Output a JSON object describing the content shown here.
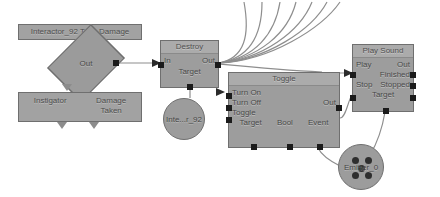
{
  "editor": {
    "name": "node-graph-editor",
    "background": "#ffffff",
    "node_fill": "#9d9d9d",
    "node_header_fill": "#ababab",
    "node_border": "#6f6f6f",
    "port_color": "#1b1b1b",
    "wire_color": "#8e8e8e"
  },
  "nodes": {
    "take_damage": {
      "title": "Interactor_92 Take Damage"
    },
    "out_diamond": {
      "label": "Out"
    },
    "event_params": {
      "param1": "Instigator",
      "param2": "Damage",
      "param3": "Taken"
    },
    "destroy": {
      "title": "Destroy",
      "in_label": "In",
      "out_label": "Out",
      "target_label": "Target"
    },
    "interactor_ref": {
      "label": "Inte...r_92"
    },
    "toggle": {
      "title": "Toggle",
      "inputs": [
        "Turn On",
        "Turn Off",
        "Toggle"
      ],
      "output": "Out",
      "bottom_ports": [
        "Target",
        "Bool",
        "Event"
      ]
    },
    "play_sound": {
      "title": "Play Sound",
      "inputs": [
        "Play",
        "Stop",
        "Target"
      ],
      "outputs": [
        "Out",
        "Finished",
        "Stopped"
      ]
    },
    "emitter": {
      "label": "Emitter_0"
    }
  }
}
